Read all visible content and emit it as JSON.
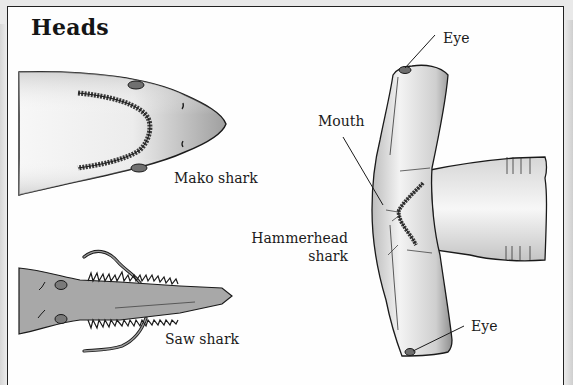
{
  "title": "Heads",
  "labels": {
    "mako": "Mako shark",
    "saw": "Saw shark",
    "hammer_line1": "Hammerhead",
    "hammer_line2": "shark",
    "mouth": "Mouth",
    "eye_top": "Eye",
    "eye_bottom": "Eye"
  },
  "illustrations": [
    {
      "name": "mako-shark-head",
      "description": "Top-down view of mako shark snout with curved row of teeth and two eyes"
    },
    {
      "name": "saw-shark-head",
      "description": "Saw shark with toothed rostrum and two barbels"
    },
    {
      "name": "hammerhead-shark-head",
      "description": "Hammerhead shark head with T-shaped cephalofoil, mouth and eyes at ends"
    }
  ],
  "colors": {
    "outline": "#1a1a1a",
    "body_light": "#f2f2f2",
    "body_shade": "#a9a9a9",
    "saw_body": "#a8a8a8",
    "eye": "#6e6e6e"
  }
}
